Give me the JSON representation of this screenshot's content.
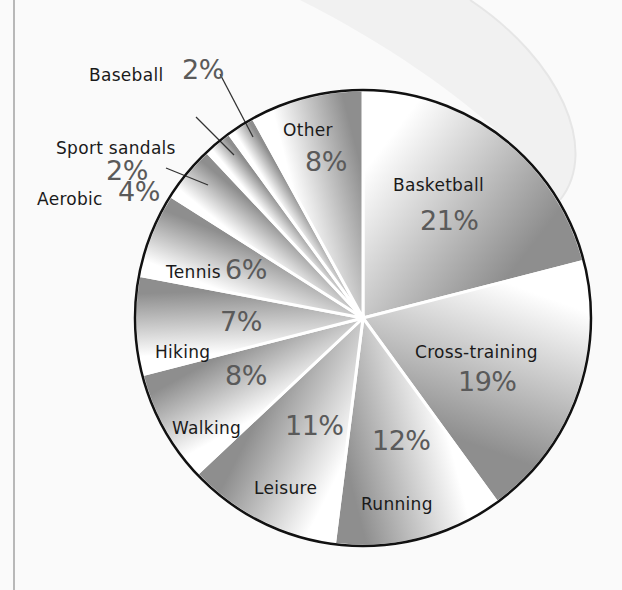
{
  "chart_data": {
    "type": "pie",
    "title": "",
    "start_angle_deg": 0,
    "direction": "clockwise",
    "slices": [
      {
        "label": "Basketball",
        "value": 21,
        "display": "21%"
      },
      {
        "label": "Cross-training",
        "value": 19,
        "display": "19%"
      },
      {
        "label": "Running",
        "value": 12,
        "display": "12%"
      },
      {
        "label": "Leisure",
        "value": 11,
        "display": "11%"
      },
      {
        "label": "Walking",
        "value": 8,
        "display": "8%"
      },
      {
        "label": "Hiking",
        "value": 7,
        "display": "7%"
      },
      {
        "label": "Tennis",
        "value": 6,
        "display": "6%"
      },
      {
        "label": "Aerobic",
        "value": 4,
        "display": "4%"
      },
      {
        "label": "Sport sandals",
        "value": 2,
        "display": "2%"
      },
      {
        "label": "Baseball",
        "value": 2,
        "display": "2%"
      },
      {
        "label": "Other",
        "value": 8,
        "display": "8%"
      }
    ],
    "categories": [
      "Basketball",
      "Cross-training",
      "Running",
      "Leisure",
      "Walking",
      "Hiking",
      "Tennis",
      "Aerobic",
      "Sport sandals",
      "Baseball",
      "Other"
    ],
    "values": [
      21,
      19,
      12,
      11,
      8,
      7,
      6,
      4,
      2,
      2,
      8
    ],
    "unit": "%",
    "legend": "none (labels placed on/around slices)",
    "colors": {
      "slice_gradient_light": "#ffffff",
      "slice_gradient_dark": "#8e8e8e",
      "separator": "#ffffff",
      "outline": "#111111",
      "percent_text": "#5a5a5a",
      "label_text": "#1a1a1a"
    }
  },
  "labels": {
    "basketball": {
      "name": "Basketball",
      "pct": "21%"
    },
    "cross_training": {
      "name": "Cross-training",
      "pct": "19%"
    },
    "running": {
      "name": "Running",
      "pct": "12%"
    },
    "leisure": {
      "name": "Leisure",
      "pct": "11%"
    },
    "walking": {
      "name": "Walking",
      "pct": "8%"
    },
    "hiking": {
      "name": "Hiking",
      "pct": "7%"
    },
    "tennis": {
      "name": "Tennis",
      "pct": "6%"
    },
    "aerobic": {
      "name": "Aerobic",
      "pct": "4%"
    },
    "sport_sandals": {
      "name": "Sport sandals",
      "pct": "2%"
    },
    "baseball": {
      "name": "Baseball",
      "pct": "2%"
    },
    "other": {
      "name": "Other",
      "pct": "8%"
    }
  }
}
